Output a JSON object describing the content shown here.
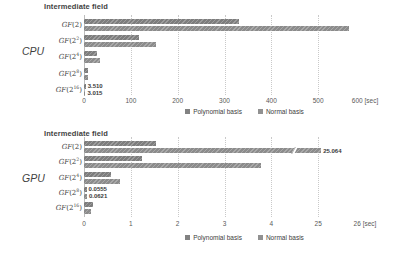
{
  "colors": {
    "poly_series": "#828282",
    "normal_series": "#919191",
    "gridline": "#c9c9c9",
    "title_text": "#3f3f3f",
    "axis_text": "#595959",
    "background": "#ffffff"
  },
  "chart_data": [
    {
      "type": "bar",
      "orientation": "horizontal",
      "title": "Intermediate field",
      "side_label": "CPU",
      "categories": [
        "GF(2)",
        "GF(2^2)",
        "GF(2^4)",
        "GF(2^8)",
        "GF(2^16)"
      ],
      "series": [
        {
          "name": "Polynomial basis",
          "values": [
            330,
            118,
            28,
            8,
            3.51
          ]
        },
        {
          "name": "Normal basis",
          "values": [
            565,
            154,
            35,
            9,
            3.015
          ]
        }
      ],
      "annotations": [
        {
          "category": 4,
          "series": 0,
          "text": "3.510"
        },
        {
          "category": 4,
          "series": 1,
          "text": "3.015"
        }
      ],
      "axis": {
        "unit": "[sec]",
        "tick_values": [
          0,
          100,
          200,
          300,
          400,
          500,
          600
        ],
        "tick_labels": [
          "0",
          "100",
          "200",
          "300",
          "400",
          "500",
          "600"
        ],
        "grid": "dotted-vertical"
      },
      "legend": [
        "Polynomial basis",
        "Normal basis"
      ],
      "legend_position": "bottom-center"
    },
    {
      "type": "bar",
      "orientation": "horizontal",
      "title": "Intermediate field",
      "side_label": "GPU",
      "categories": [
        "GF(2)",
        "GF(2^2)",
        "GF(2^4)",
        "GF(2^8)",
        "GF(2^16)"
      ],
      "series": [
        {
          "name": "Polynomial basis",
          "values": [
            1.54,
            1.24,
            0.58,
            0.0555,
            0.2
          ]
        },
        {
          "name": "Normal basis",
          "values": [
            25.064,
            3.78,
            0.77,
            0.0621,
            0.15
          ]
        }
      ],
      "annotations": [
        {
          "category": 0,
          "series": 1,
          "text": "25.064"
        },
        {
          "category": 3,
          "series": 0,
          "text": "0.0555"
        },
        {
          "category": 3,
          "series": 1,
          "text": "0.0621"
        }
      ],
      "axis": {
        "unit": "[sec]",
        "tick_values": [
          0,
          1,
          2,
          3,
          4,
          25,
          26
        ],
        "tick_labels": [
          "0",
          "1",
          "2",
          "3",
          "4",
          "25",
          "26"
        ],
        "break_between": [
          4,
          25
        ],
        "grid": "dotted-vertical"
      },
      "broken_bars": [
        {
          "category": 0,
          "series": 1
        }
      ],
      "legend": [
        "Polynomial basis",
        "Normal basis"
      ],
      "legend_position": "bottom-center"
    }
  ]
}
